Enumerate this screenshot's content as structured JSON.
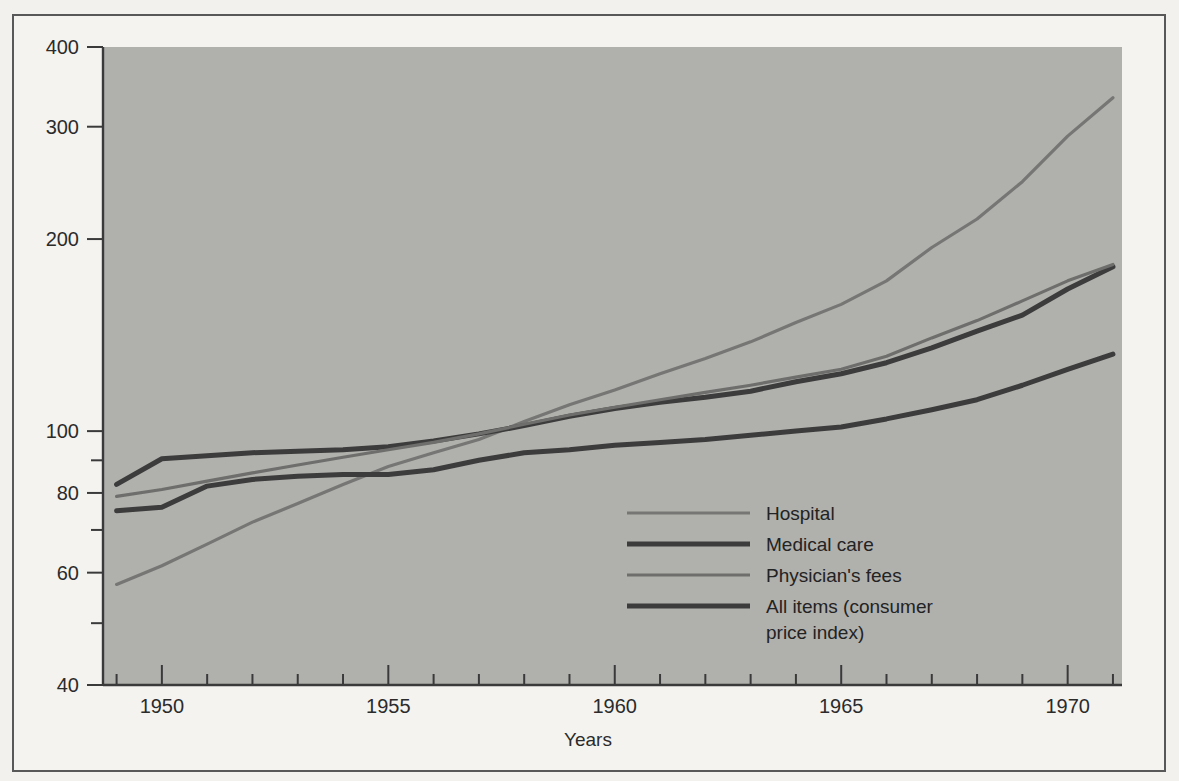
{
  "figure": {
    "background_color": "#f2f1ee",
    "frame_color": "#585858",
    "plot_background_color": "#b0b0ad"
  },
  "chart_data": {
    "type": "line",
    "title": "",
    "xlabel": "Years",
    "ylabel": "",
    "yscale": "log",
    "ylim": [
      40,
      400
    ],
    "xlim": [
      1948.7,
      1971.2
    ],
    "grid": false,
    "legend_position": "center-right-inside",
    "y_tick_labels": [
      "400",
      "300",
      "200",
      "100",
      "80",
      "60",
      "40"
    ],
    "y_tick_values": [
      400,
      300,
      200,
      100,
      80,
      60,
      40
    ],
    "y_minor_tick_values": [
      90,
      70,
      50
    ],
    "x_tick_labels": [
      "1950",
      "1955",
      "1960",
      "1965",
      "1970"
    ],
    "x_tick_values": [
      1950,
      1955,
      1960,
      1965,
      1970
    ],
    "x_minor_tick_values": [
      1949,
      1951,
      1952,
      1953,
      1954,
      1956,
      1957,
      1958,
      1959,
      1961,
      1962,
      1963,
      1964,
      1966,
      1967,
      1968,
      1969,
      1971
    ],
    "x": [
      1949,
      1950,
      1951,
      1952,
      1953,
      1954,
      1955,
      1956,
      1957,
      1958,
      1959,
      1960,
      1961,
      1962,
      1963,
      1964,
      1965,
      1966,
      1967,
      1968,
      1969,
      1970,
      1971
    ],
    "series": [
      {
        "name": "Hospital",
        "color": "#767674",
        "width": 3.2,
        "values": [
          57.5,
          61.5,
          66.5,
          72.0,
          77.0,
          82.5,
          88.0,
          92.5,
          97.0,
          103.5,
          110.0,
          116.0,
          123.0,
          130.0,
          138.0,
          148.0,
          158.0,
          172.0,
          194.0,
          215.0,
          246.0,
          290.0,
          333.0
        ]
      },
      {
        "name": "Medical care",
        "color": "#3c3c3c",
        "width": 5.0,
        "values": [
          82.5,
          90.5,
          91.5,
          92.5,
          93.0,
          93.5,
          94.5,
          96.5,
          99.0,
          102.0,
          105.5,
          108.5,
          111.0,
          113.0,
          115.5,
          119.5,
          123.0,
          128.0,
          135.0,
          143.5,
          152.0,
          167.0,
          181.0
        ]
      },
      {
        "name": "Physician's fees",
        "color": "#6e6e6c",
        "width": 3.2,
        "values": [
          79.0,
          81.0,
          83.5,
          86.0,
          88.5,
          91.0,
          93.5,
          96.0,
          99.0,
          102.5,
          106.0,
          109.0,
          112.0,
          115.0,
          118.0,
          121.5,
          125.0,
          131.0,
          140.0,
          149.0,
          160.0,
          172.0,
          182.5
        ]
      },
      {
        "name": "All items (consumer price index)",
        "color": "#3c3c3c",
        "width": 5.0,
        "values": [
          75.0,
          76.0,
          82.0,
          84.0,
          85.0,
          85.5,
          85.5,
          87.0,
          90.0,
          92.5,
          93.5,
          95.0,
          96.0,
          97.0,
          98.5,
          100.0,
          101.5,
          104.5,
          108.0,
          112.0,
          118.0,
          125.0,
          132.0
        ]
      }
    ],
    "legend_entries": [
      {
        "label": "Hospital",
        "color": "#767674",
        "width": 3.2
      },
      {
        "label": "Medical care",
        "color": "#3c3c3c",
        "width": 5.0
      },
      {
        "label": "Physician's fees",
        "color": "#6e6e6c",
        "width": 3.2
      },
      {
        "label": "All items (consumer",
        "label_line2": "price index)",
        "color": "#3c3c3c",
        "width": 5.0
      }
    ]
  }
}
